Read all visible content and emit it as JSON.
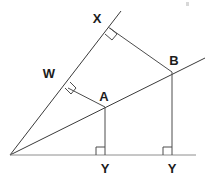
{
  "figure": {
    "background_color": "#ffffff",
    "line_color": "#4c4c4c",
    "label_color": "#1c1c1c",
    "width": 207,
    "height": 182
  },
  "labels": {
    "x_point": "X",
    "w_point": "W",
    "a_point": "A",
    "b_point": "B",
    "y_left": "Y",
    "y_right": "Y"
  },
  "points": {
    "origin": {
      "x": 10,
      "y": 155
    },
    "X": {
      "x": 108,
      "y": 27
    },
    "W": {
      "x": 68,
      "y": 88
    },
    "A": {
      "x": 105,
      "y": 107
    },
    "B": {
      "x": 172,
      "y": 72
    },
    "Y_left": {
      "x": 105,
      "y": 155
    },
    "Y_right": {
      "x": 172,
      "y": 155
    },
    "ray_upper_end": {
      "x": 121,
      "y": 11
    },
    "ray_slant_end": {
      "x": 205,
      "y": 58
    },
    "baseline_end": {
      "x": 196,
      "y": 155
    }
  },
  "label_positions": {
    "X": {
      "x": 97,
      "y": 20
    },
    "W": {
      "x": 49,
      "y": 75
    },
    "A": {
      "x": 104,
      "y": 98
    },
    "B": {
      "x": 173,
      "y": 62
    },
    "Y_left": {
      "x": 105,
      "y": 170
    },
    "Y_right": {
      "x": 172,
      "y": 170
    }
  },
  "segments": [
    {
      "name": "ray-origin-through-W-X",
      "from": "origin",
      "to": "ray_upper_end"
    },
    {
      "name": "ray-origin-through-A-B",
      "from": "origin",
      "to": "ray_slant_end"
    },
    {
      "name": "baseline",
      "from": "origin",
      "to": "baseline_end"
    },
    {
      "name": "segment-X-B",
      "from": "X",
      "to": "B"
    },
    {
      "name": "segment-W-A",
      "from": "W",
      "to": "A"
    },
    {
      "name": "altitude-A-Y",
      "from": "A",
      "to": "Y_left"
    },
    {
      "name": "altitude-B-Y",
      "from": "B",
      "to": "Y_right"
    }
  ],
  "right_angles": [
    {
      "name": "right-angle-at-X",
      "vertex": "X"
    },
    {
      "name": "right-angle-at-W",
      "vertex": "W"
    },
    {
      "name": "right-angle-at-Y-left",
      "vertex": "Y_left"
    },
    {
      "name": "right-angle-at-Y-right",
      "vertex": "Y_right"
    }
  ]
}
